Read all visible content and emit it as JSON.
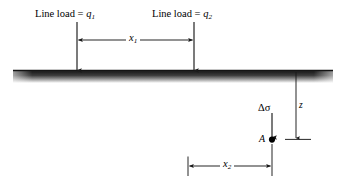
{
  "figure": {
    "type": "engineering-diagram",
    "background_color": "#ffffff",
    "line_color": "#1a1a1a",
    "ground_color": "#262626"
  },
  "labels": {
    "load1_prefix": "Line load = ",
    "load1_var": "q",
    "load1_sub": "1",
    "load2_prefix": "Line load = ",
    "load2_var": "q",
    "load2_sub": "2",
    "dim_x1_var": "x",
    "dim_x1_sub": "1",
    "dim_x2_var": "x",
    "dim_x2_sub": "2",
    "delta_sigma": "Δσ",
    "depth_z": "z",
    "point_a": "A"
  },
  "geometry": {
    "ground_left": 13,
    "ground_right": 333,
    "ground_top": 70,
    "ground_height": 7,
    "load1_x": 77,
    "load2_x": 194,
    "load_arrow_top": 22,
    "load_arrow_bottom": 70,
    "dim_x1_y": 40,
    "z_line_x": 296,
    "z_line_top": 77,
    "z_line_bottom": 138,
    "sigma_arrow_x": 272,
    "sigma_arrow_top": 113,
    "sigma_arrow_bottom": 137,
    "point_a_x": 272,
    "point_a_y": 139,
    "dim_x2_y": 166,
    "dim_x2_left": 188,
    "dim_x2_right": 272
  }
}
